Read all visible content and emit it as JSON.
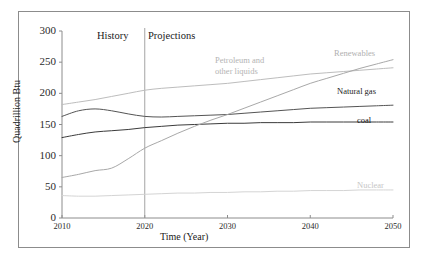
{
  "chart_data": {
    "type": "line",
    "title": "",
    "xlabel": "Time (Year)",
    "ylabel": "Quadrillion Btu",
    "xlim": [
      2010,
      2050
    ],
    "ylim": [
      0,
      300
    ],
    "xticks": [
      "2010",
      "2020",
      "2030",
      "2040",
      "2050"
    ],
    "yticks": [
      "0",
      "50",
      "100",
      "150",
      "200",
      "250",
      "300"
    ],
    "grid": false,
    "legend": "inline-labels",
    "annotations": {
      "history": "History",
      "projections": "Projections",
      "divider_year": 2020
    },
    "x": [
      2010,
      2012,
      2014,
      2016,
      2018,
      2020,
      2022,
      2024,
      2026,
      2028,
      2030,
      2032,
      2034,
      2036,
      2038,
      2040,
      2042,
      2044,
      2046,
      2048,
      2050
    ],
    "series": [
      {
        "name": "Petroleum and other liquids",
        "color": "#bdbdbd",
        "values": [
          182,
          186,
          190,
          195,
          200,
          205,
          208,
          210,
          212,
          214,
          216,
          219,
          222,
          225,
          228,
          231,
          233,
          235,
          237,
          239,
          241
        ]
      },
      {
        "name": "Natural gas",
        "color": "#545454",
        "values": [
          163,
          172,
          175,
          172,
          167,
          163,
          162,
          163,
          164,
          165,
          166,
          168,
          170,
          172,
          174,
          176,
          177,
          178,
          179,
          180,
          181
        ]
      },
      {
        "name": "coal",
        "color": "#3b3b3b",
        "values": [
          129,
          134,
          138,
          140,
          142,
          145,
          147,
          149,
          150,
          151,
          152,
          152,
          153,
          153,
          153,
          154,
          154,
          154,
          154,
          154,
          154
        ]
      },
      {
        "name": "Renewables",
        "color": "#a8a8a8",
        "values": [
          65,
          70,
          76,
          80,
          95,
          112,
          124,
          136,
          147,
          157,
          166,
          176,
          186,
          196,
          206,
          216,
          224,
          232,
          240,
          247,
          254
        ]
      },
      {
        "name": "Nuclear",
        "color": "#d4d4d4",
        "values": [
          36,
          35,
          35,
          36,
          37,
          38,
          39,
          40,
          40,
          41,
          41,
          42,
          42,
          43,
          43,
          44,
          44,
          44,
          45,
          45,
          45
        ]
      }
    ],
    "series_label_positions": {
      "petroleum_line1": "Petroleum and",
      "petroleum_line2": "other liquids",
      "renewables": "Renewables",
      "natural_gas": "Natural gas",
      "coal": "coal",
      "nuclear": "Nuclear"
    },
    "colors": {
      "petroleum": "#bdbdbd",
      "natural_gas": "#545454",
      "coal": "#3b3b3b",
      "renewables": "#a8a8a8",
      "nuclear": "#d4d4d4",
      "axis": "#8c8c8c",
      "divider": "#9a9a9a",
      "text": "#1a1a1a"
    }
  }
}
